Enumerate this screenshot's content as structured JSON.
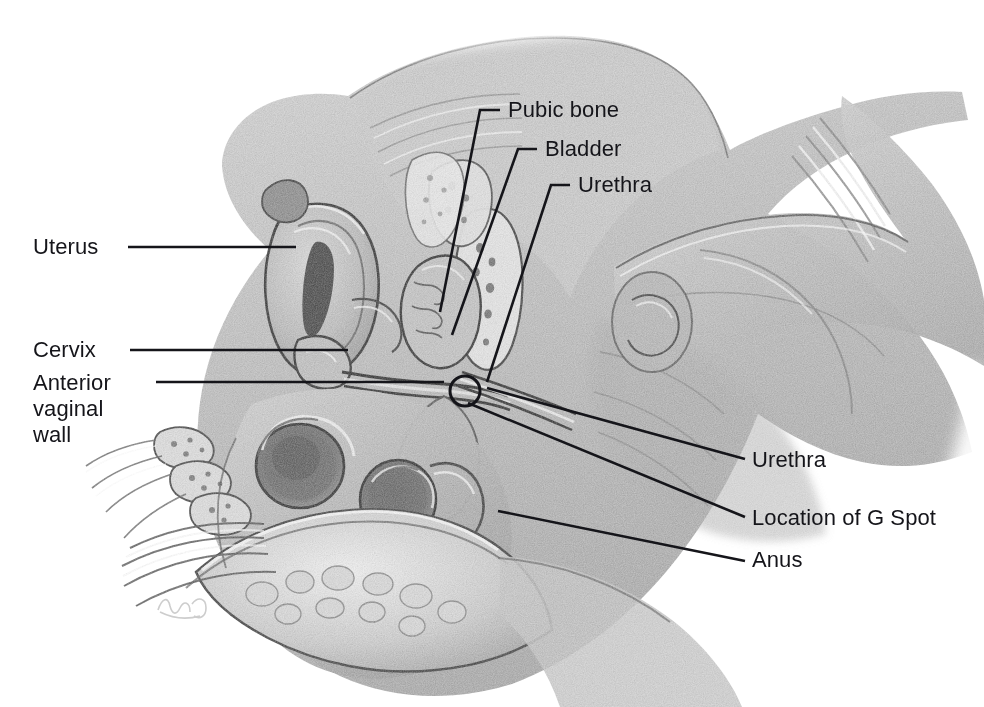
{
  "figure": {
    "kind": "anatomical-illustration",
    "medium": "graphite pencil drawing",
    "background_color": "#ffffff",
    "ink_color": "#15151a",
    "width": 984,
    "height": 707
  },
  "labels": [
    {
      "id": "uterus",
      "text": "Uterus",
      "side": "left",
      "x": 33,
      "y": 234,
      "leader": {
        "type": "straight",
        "points": "128,247 296,247"
      }
    },
    {
      "id": "cervix",
      "text": "Cervix",
      "side": "left",
      "x": 33,
      "y": 337,
      "leader": {
        "type": "straight",
        "points": "130,350 348,350"
      }
    },
    {
      "id": "anterior-vaginal-wall",
      "text": "Anterior\nvaginal\nwall",
      "side": "left",
      "x": 33,
      "y": 370,
      "leader": {
        "type": "straight",
        "points": "156,382 444,382"
      }
    },
    {
      "id": "pubic-bone",
      "text": "Pubic bone",
      "side": "top",
      "x": 508,
      "y": 97,
      "leader": {
        "type": "elbow",
        "points": "500,110 480,110 440,312"
      }
    },
    {
      "id": "bladder",
      "text": "Bladder",
      "side": "top",
      "x": 545,
      "y": 136,
      "leader": {
        "type": "elbow",
        "points": "537,149 518,149 452,335"
      }
    },
    {
      "id": "urethra-top",
      "text": "Urethra",
      "side": "top",
      "x": 578,
      "y": 172,
      "leader": {
        "type": "elbow",
        "points": "570,185 551,185 487,382"
      }
    },
    {
      "id": "urethra-right",
      "text": "Urethra",
      "side": "right",
      "x": 752,
      "y": 447,
      "leader": {
        "type": "straight",
        "points": "487,388 745,459"
      }
    },
    {
      "id": "location-of-g-spot",
      "text": "Location of G Spot",
      "side": "right",
      "x": 752,
      "y": 505,
      "leader": {
        "type": "straight",
        "points": "468,403 745,517"
      }
    },
    {
      "id": "anus",
      "text": "Anus",
      "side": "right",
      "x": 752,
      "y": 547,
      "leader": {
        "type": "straight",
        "points": "498,511 745,561"
      }
    }
  ],
  "markers": [
    {
      "id": "g-spot-circle",
      "shape": "circle",
      "cx": 465,
      "cy": 391,
      "r": 15,
      "stroke": "#15151a",
      "stroke_width": 3
    }
  ]
}
